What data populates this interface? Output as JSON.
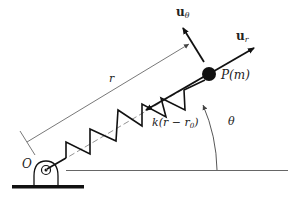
{
  "diagram": {
    "labels": {
      "origin": "O",
      "mass": "P(m)",
      "radius": "r",
      "angle": "θ",
      "spring_force": "k(r − r",
      "spring_force_sub": "0",
      "spring_force_close": ")",
      "unit_r_base": "u",
      "unit_r_sub": "r",
      "unit_theta_base": "u",
      "unit_theta_sub": "θ"
    },
    "colors": {
      "ink": "#111111",
      "thin_line": "#555555",
      "background": "#ffffff"
    }
  }
}
